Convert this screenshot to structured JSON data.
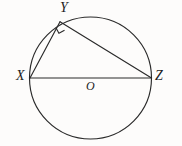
{
  "figure": {
    "caption": "Circle with inscribed right triangle XYZ on diameter XZ",
    "background_color": "#fdfcfb",
    "stroke_color": "#2a2a2a",
    "labels": {
      "Y": "Y",
      "X": "X",
      "Z": "Z",
      "O": "O"
    },
    "elements": {
      "circle_name": "circle",
      "center_name": "center-point-O",
      "diameter_name": "segment-XZ",
      "chord_xy_name": "segment-XY",
      "chord_yz_name": "segment-YZ",
      "right_angle_name": "right-angle-marker-at-Y"
    },
    "geometry": {
      "circle": {
        "cx": 90.5,
        "cy": 78,
        "r": 61
      },
      "points": {
        "X": {
          "x": 30,
          "y": 78
        },
        "Z": {
          "x": 151.5,
          "y": 78
        },
        "Y": {
          "x": 60,
          "y": 21.8
        },
        "O": {
          "x": 90.5,
          "y": 78
        }
      },
      "segments": [
        {
          "name": "XZ",
          "from": "X",
          "to": "Z"
        },
        {
          "name": "XY",
          "from": "X",
          "to": "Y"
        },
        {
          "name": "YZ",
          "from": "Y",
          "to": "Z"
        }
      ],
      "right_angle_at": "Y",
      "right_angle_measure": "90"
    }
  }
}
